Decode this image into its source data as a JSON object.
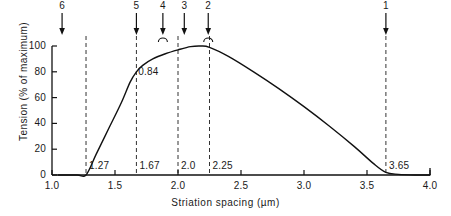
{
  "chart_data": {
    "type": "line",
    "title": "",
    "xlabel": "Striation spacing (µm)",
    "ylabel": "Tension (% of maximum)",
    "xlim": [
      1.0,
      4.0
    ],
    "ylim": [
      0,
      100
    ],
    "xticks": [
      "1.0",
      "1.5",
      "2.0",
      "2.5",
      "3.0",
      "3.5",
      "4.0"
    ],
    "xtick_values": [
      1.0,
      1.5,
      2.0,
      2.5,
      3.0,
      3.5,
      4.0
    ],
    "yticks": [
      "0",
      "20",
      "40",
      "60",
      "80",
      "100"
    ],
    "ytick_values": [
      0,
      20,
      40,
      60,
      80,
      100
    ],
    "grid": false,
    "legend": "none",
    "series": [
      {
        "name": "Tension",
        "points": [
          [
            1.05,
            0
          ],
          [
            1.2,
            0
          ],
          [
            1.27,
            0
          ],
          [
            1.35,
            16
          ],
          [
            1.45,
            36
          ],
          [
            1.55,
            56
          ],
          [
            1.62,
            72
          ],
          [
            1.67,
            80
          ],
          [
            1.72,
            85
          ],
          [
            1.8,
            90
          ],
          [
            1.9,
            94
          ],
          [
            2.0,
            97
          ],
          [
            2.1,
            99.5
          ],
          [
            2.18,
            100
          ],
          [
            2.25,
            99
          ],
          [
            2.4,
            92
          ],
          [
            2.6,
            80
          ],
          [
            2.8,
            67
          ],
          [
            3.0,
            53
          ],
          [
            3.2,
            38
          ],
          [
            3.4,
            22
          ],
          [
            3.55,
            9
          ],
          [
            3.65,
            2
          ],
          [
            3.75,
            0.5
          ],
          [
            3.9,
            0
          ],
          [
            4.0,
            0
          ]
        ]
      }
    ],
    "vlines": [
      {
        "x": 1.27,
        "label": "1.27"
      },
      {
        "x": 1.67,
        "label": "1.67"
      },
      {
        "x": 2.0,
        "label": "2.0"
      },
      {
        "x": 2.25,
        "label": "2.25"
      },
      {
        "x": 3.65,
        "label": "3.65"
      }
    ],
    "annotations": [
      {
        "text": "0.84",
        "x": 1.78,
        "y": 80
      }
    ],
    "arrows": [
      {
        "label": "6",
        "x": 1.08,
        "arc": false
      },
      {
        "label": "5",
        "x": 1.67,
        "arc": false
      },
      {
        "label": "4",
        "x": 1.88,
        "arc": true
      },
      {
        "label": "3",
        "x": 2.05,
        "arc": false
      },
      {
        "label": "2",
        "x": 2.24,
        "arc": true
      },
      {
        "label": "1",
        "x": 3.65,
        "arc": false
      }
    ],
    "colors": {
      "curve": "#111111",
      "axis": "#111111",
      "dashed": "#333333",
      "text": "#1a1a1a"
    }
  }
}
